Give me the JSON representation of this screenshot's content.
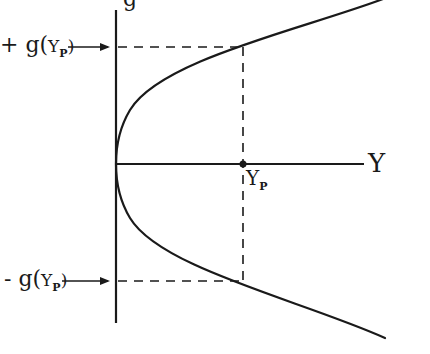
{
  "diagram": {
    "type": "parabola-diagram",
    "vertical_axis_label": "g",
    "horizontal_axis_label": "Y",
    "point_label": {
      "main": "Y",
      "subscript": "P"
    },
    "upper_label": {
      "sign": "+",
      "func": "g(",
      "var": "Y",
      "subscript": "P",
      "close": ")"
    },
    "lower_label": {
      "sign": "-",
      "func": "g(",
      "var": "Y",
      "subscript": "P",
      "close": ")"
    },
    "colors": {
      "stroke": "#1a1a1a",
      "background": "#ffffff"
    }
  }
}
